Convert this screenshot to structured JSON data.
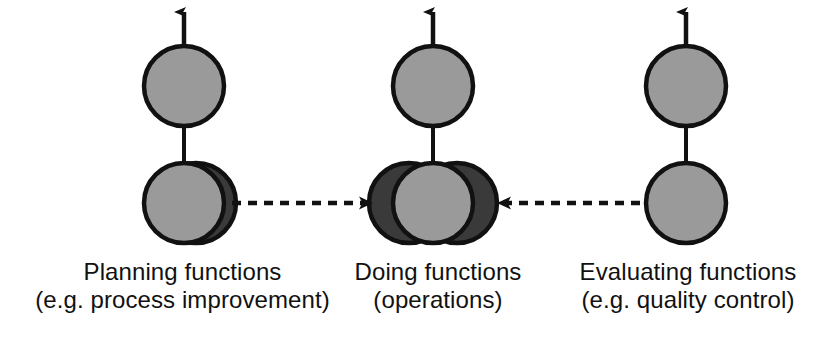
{
  "diagram": {
    "background_color": "#ffffff",
    "node_fill_light": "#9a9a9a",
    "node_fill_dark": "#3a3a3a",
    "stroke_color": "#111111",
    "text_color": "#111111",
    "columns": [
      {
        "id": "planning",
        "label_line_1": "Planning functions",
        "label_line_2": "(e.g. process improvement)",
        "top_node": {
          "shape": "circle",
          "fill": "#9a9a9a",
          "cx": 184,
          "cy": 86,
          "r": 40
        },
        "bottom_node": {
          "shape": "circle",
          "fill": "#9a9a9a",
          "cx": 184,
          "cy": 203,
          "r": 40,
          "shadow_circles": [
            {
              "fill": "#3a3a3a",
              "cx": 196,
              "cy": 203,
              "r": 40
            }
          ]
        },
        "connector": {
          "type": "solid-line",
          "x": 184,
          "y1": 126,
          "y2": 163
        },
        "out_arrow": {
          "type": "solid-arrow-up",
          "x": 184,
          "y_tail": 46,
          "y_tip": 8
        }
      },
      {
        "id": "doing",
        "label_line_1": "Doing functions",
        "label_line_2": "(operations)",
        "top_node": {
          "shape": "circle",
          "fill": "#9a9a9a",
          "cx": 433,
          "cy": 86,
          "r": 40
        },
        "bottom_node": {
          "shape": "circle",
          "fill": "#9a9a9a",
          "cx": 433,
          "cy": 203,
          "r": 40,
          "shadow_circles": [
            {
              "fill": "#3a3a3a",
              "cx": 409,
              "cy": 203,
              "r": 40
            },
            {
              "fill": "#3a3a3a",
              "cx": 457,
              "cy": 203,
              "r": 40
            }
          ]
        },
        "connector": {
          "type": "solid-line",
          "x": 433,
          "y1": 126,
          "y2": 163
        },
        "out_arrow": {
          "type": "solid-arrow-up",
          "x": 433,
          "y_tail": 46,
          "y_tip": 8
        }
      },
      {
        "id": "evaluating",
        "label_line_1": "Evaluating functions",
        "label_line_2": "(e.g. quality control)",
        "top_node": {
          "shape": "circle",
          "fill": "#9a9a9a",
          "cx": 686,
          "cy": 86,
          "r": 40
        },
        "bottom_node": {
          "shape": "circle",
          "fill": "#9a9a9a",
          "cx": 686,
          "cy": 203,
          "r": 40,
          "shadow_circles": []
        },
        "connector": {
          "type": "solid-line",
          "x": 686,
          "y1": 126,
          "y2": 163
        },
        "out_arrow": {
          "type": "solid-arrow-up",
          "x": 686,
          "y_tail": 46,
          "y_tip": 8
        }
      }
    ],
    "flow_arrows": [
      {
        "id": "planning-to-doing",
        "style": "dashed",
        "direction": "right",
        "from": "planning",
        "to": "doing",
        "x1": 232,
        "x2": 376,
        "y": 203
      },
      {
        "id": "evaluating-to-doing",
        "style": "dashed",
        "direction": "left",
        "from": "evaluating",
        "to": "doing",
        "x1": 640,
        "x2": 494,
        "y": 203
      }
    ]
  }
}
